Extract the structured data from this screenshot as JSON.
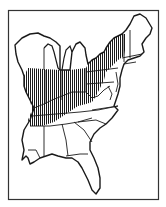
{
  "map": {
    "type": "range-map",
    "region": "Eastern United States",
    "colors": {
      "background": "#ffffff",
      "outline": "#1a1a1a",
      "hatch": "#1a1a1a",
      "frame": "#333333"
    },
    "legend": [],
    "shaded_area_pattern": "vertical-hatching",
    "shaded_states": [
      "Illinois",
      "Indiana",
      "Ohio",
      "Kentucky",
      "Tennessee",
      "Pennsylvania",
      "New York",
      "Vermont",
      "West Virginia",
      "northern Mississippi",
      "northern Alabama",
      "western Virginia",
      "southern Wisconsin",
      "southern Michigan"
    ]
  }
}
